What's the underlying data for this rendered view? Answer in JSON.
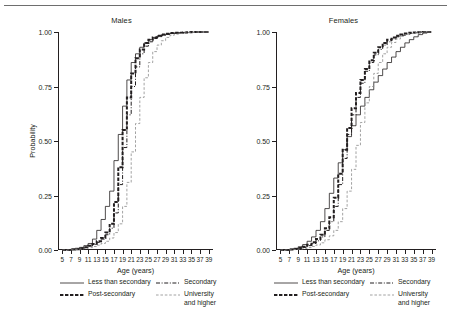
{
  "chart_data": {
    "type": "line",
    "title": "",
    "panels": [
      {
        "name": "Males",
        "title": "Males",
        "xlabel": "Age (years)",
        "ylabel": "Probability",
        "xlim": [
          4,
          40
        ],
        "ylim": [
          0,
          1
        ],
        "xticks": [
          5,
          7,
          9,
          11,
          13,
          15,
          17,
          19,
          21,
          23,
          25,
          27,
          29,
          31,
          33,
          35,
          37,
          39
        ],
        "yticks": [
          0.0,
          0.25,
          0.5,
          0.75,
          1.0
        ],
        "ytick_labels": [
          "0.00",
          "0.25",
          "0.50",
          "0.75",
          "1.00"
        ],
        "grid": false,
        "series": [
          {
            "name": "Less than secondary",
            "style": "solid",
            "x": [
              5,
              6,
              7,
              8,
              9,
              10,
              11,
              12,
              13,
              14,
              15,
              16,
              17,
              18,
              19,
              20,
              21,
              22,
              23,
              24,
              25,
              26,
              27,
              28,
              29,
              30,
              31,
              32,
              33,
              34,
              35,
              36,
              37,
              38,
              39
            ],
            "y": [
              0.0,
              0.0,
              0.005,
              0.008,
              0.012,
              0.02,
              0.03,
              0.05,
              0.09,
              0.14,
              0.2,
              0.27,
              0.41,
              0.53,
              0.66,
              0.78,
              0.86,
              0.9,
              0.93,
              0.95,
              0.965,
              0.975,
              0.982,
              0.987,
              0.99,
              0.993,
              0.995,
              0.996,
              0.997,
              0.998,
              0.999,
              1.0,
              1.0,
              1.0,
              1.0
            ]
          },
          {
            "name": "Secondary",
            "style": "dash-dot",
            "x": [
              5,
              6,
              7,
              8,
              9,
              10,
              11,
              12,
              13,
              14,
              15,
              16,
              17,
              18,
              19,
              20,
              21,
              22,
              23,
              24,
              25,
              26,
              27,
              28,
              29,
              30,
              31,
              32,
              33,
              34,
              35,
              36,
              37,
              38,
              39
            ],
            "y": [
              0.0,
              0.0,
              0.002,
              0.004,
              0.008,
              0.012,
              0.018,
              0.025,
              0.035,
              0.05,
              0.07,
              0.1,
              0.17,
              0.3,
              0.47,
              0.62,
              0.75,
              0.84,
              0.9,
              0.935,
              0.955,
              0.97,
              0.978,
              0.985,
              0.99,
              0.993,
              0.995,
              0.997,
              0.998,
              0.999,
              1.0,
              1.0,
              1.0,
              1.0,
              1.0
            ]
          },
          {
            "name": "Post-secondary",
            "style": "thick-dash",
            "x": [
              5,
              6,
              7,
              8,
              9,
              10,
              11,
              12,
              13,
              14,
              15,
              16,
              17,
              18,
              19,
              20,
              21,
              22,
              23,
              24,
              25,
              26,
              27,
              28,
              29,
              30,
              31,
              32,
              33,
              34,
              35,
              36,
              37,
              38,
              39
            ],
            "y": [
              0.0,
              0.0,
              0.002,
              0.004,
              0.008,
              0.013,
              0.02,
              0.028,
              0.04,
              0.055,
              0.08,
              0.12,
              0.22,
              0.38,
              0.55,
              0.7,
              0.81,
              0.88,
              0.92,
              0.95,
              0.965,
              0.975,
              0.983,
              0.988,
              0.992,
              0.995,
              0.996,
              0.997,
              0.998,
              0.999,
              1.0,
              1.0,
              1.0,
              1.0,
              1.0
            ]
          },
          {
            "name": "University and higher",
            "style": "dotted",
            "x": [
              5,
              6,
              7,
              8,
              9,
              10,
              11,
              12,
              13,
              14,
              15,
              16,
              17,
              18,
              19,
              20,
              21,
              22,
              23,
              24,
              25,
              26,
              27,
              28,
              29,
              30,
              31,
              32,
              33,
              34,
              35,
              36,
              37,
              38,
              39
            ],
            "y": [
              0.0,
              0.0,
              0.001,
              0.002,
              0.004,
              0.007,
              0.011,
              0.016,
              0.022,
              0.03,
              0.04,
              0.055,
              0.08,
              0.12,
              0.2,
              0.31,
              0.45,
              0.58,
              0.7,
              0.79,
              0.86,
              0.91,
              0.94,
              0.96,
              0.975,
              0.985,
              0.99,
              0.993,
              0.996,
              0.998,
              0.999,
              1.0,
              1.0,
              1.0,
              1.0
            ]
          }
        ]
      },
      {
        "name": "Females",
        "title": "Females",
        "xlabel": "Age (years)",
        "ylabel": "Probability",
        "xlim": [
          4,
          40
        ],
        "ylim": [
          0,
          1
        ],
        "xticks": [
          5,
          7,
          9,
          11,
          13,
          15,
          17,
          19,
          21,
          23,
          25,
          27,
          29,
          31,
          33,
          35,
          37,
          39
        ],
        "yticks": [
          0.0,
          0.25,
          0.5,
          0.75,
          1.0
        ],
        "ytick_labels": [
          "0.00",
          "0.25",
          "0.50",
          "0.75",
          "1.00"
        ],
        "grid": false,
        "series": [
          {
            "name": "Less than secondary",
            "style": "solid",
            "x": [
              5,
              6,
              7,
              8,
              9,
              10,
              11,
              12,
              13,
              14,
              15,
              16,
              17,
              18,
              19,
              20,
              21,
              22,
              23,
              24,
              25,
              26,
              27,
              28,
              29,
              30,
              31,
              32,
              33,
              34,
              35,
              36,
              37,
              38,
              39
            ],
            "y": [
              0.0,
              0.0,
              0.004,
              0.008,
              0.015,
              0.025,
              0.04,
              0.06,
              0.09,
              0.13,
              0.19,
              0.26,
              0.33,
              0.4,
              0.46,
              0.52,
              0.57,
              0.62,
              0.66,
              0.7,
              0.735,
              0.77,
              0.8,
              0.83,
              0.86,
              0.885,
              0.91,
              0.93,
              0.95,
              0.965,
              0.978,
              0.988,
              0.995,
              1.0,
              1.0
            ]
          },
          {
            "name": "Secondary",
            "style": "dash-dot",
            "x": [
              5,
              6,
              7,
              8,
              9,
              10,
              11,
              12,
              13,
              14,
              15,
              16,
              17,
              18,
              19,
              20,
              21,
              22,
              23,
              24,
              25,
              26,
              27,
              28,
              29,
              30,
              31,
              32,
              33,
              34,
              35,
              36,
              37,
              38,
              39
            ],
            "y": [
              0.0,
              0.0,
              0.002,
              0.004,
              0.007,
              0.012,
              0.02,
              0.03,
              0.042,
              0.06,
              0.09,
              0.13,
              0.2,
              0.3,
              0.42,
              0.53,
              0.62,
              0.7,
              0.765,
              0.82,
              0.86,
              0.895,
              0.92,
              0.94,
              0.955,
              0.968,
              0.978,
              0.985,
              0.99,
              0.994,
              0.997,
              0.999,
              1.0,
              1.0,
              1.0
            ]
          },
          {
            "name": "Post-secondary",
            "style": "thick-dash",
            "x": [
              5,
              6,
              7,
              8,
              9,
              10,
              11,
              12,
              13,
              14,
              15,
              16,
              17,
              18,
              19,
              20,
              21,
              22,
              23,
              24,
              25,
              26,
              27,
              28,
              29,
              30,
              31,
              32,
              33,
              34,
              35,
              36,
              37,
              38,
              39
            ],
            "y": [
              0.0,
              0.0,
              0.002,
              0.005,
              0.009,
              0.015,
              0.024,
              0.035,
              0.05,
              0.07,
              0.1,
              0.15,
              0.24,
              0.35,
              0.46,
              0.56,
              0.65,
              0.72,
              0.78,
              0.83,
              0.87,
              0.905,
              0.93,
              0.95,
              0.965,
              0.975,
              0.983,
              0.989,
              0.993,
              0.996,
              0.998,
              0.999,
              1.0,
              1.0,
              1.0
            ]
          },
          {
            "name": "University and higher",
            "style": "dotted",
            "x": [
              5,
              6,
              7,
              8,
              9,
              10,
              11,
              12,
              13,
              14,
              15,
              16,
              17,
              18,
              19,
              20,
              21,
              22,
              23,
              24,
              25,
              26,
              27,
              28,
              29,
              30,
              31,
              32,
              33,
              34,
              35,
              36,
              37,
              38,
              39
            ],
            "y": [
              0.0,
              0.0,
              0.001,
              0.002,
              0.004,
              0.007,
              0.011,
              0.016,
              0.023,
              0.033,
              0.047,
              0.065,
              0.09,
              0.13,
              0.19,
              0.27,
              0.37,
              0.48,
              0.585,
              0.675,
              0.75,
              0.81,
              0.86,
              0.9,
              0.93,
              0.952,
              0.968,
              0.98,
              0.988,
              0.993,
              0.997,
              0.999,
              1.0,
              1.0,
              1.0
            ]
          }
        ]
      }
    ],
    "legend": {
      "position": "below",
      "entries": [
        {
          "label": "Less than secondary",
          "style": "solid"
        },
        {
          "label": "Secondary",
          "style": "dash-dot"
        },
        {
          "label": "Post-secondary",
          "style": "thick-dash"
        },
        {
          "label": "University\nand higher",
          "style": "dotted"
        }
      ]
    }
  }
}
